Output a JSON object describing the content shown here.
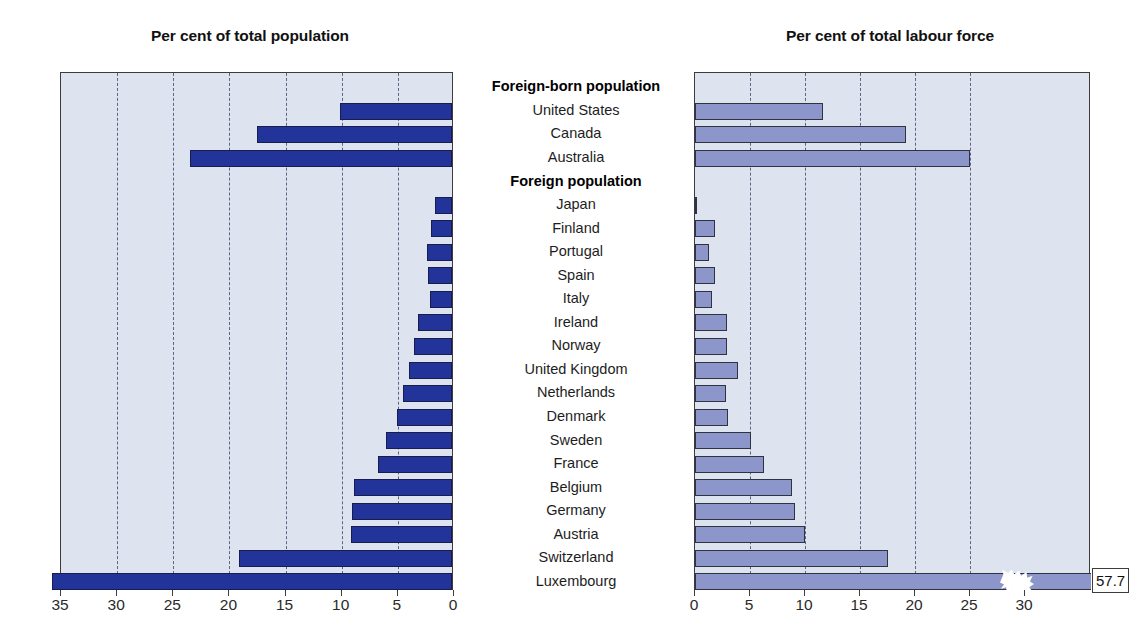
{
  "left_chart": {
    "title": "Per cent of total population",
    "axis_ticks": [
      "35",
      "30",
      "25",
      "20",
      "15",
      "10",
      "5",
      "0"
    ]
  },
  "right_chart": {
    "title": "Per cent of total labour force",
    "axis_ticks": [
      "0",
      "5",
      "10",
      "15",
      "20",
      "25",
      "30"
    ],
    "luxembourg_value_label": "57.7"
  },
  "colors": {
    "left_bar": "#22349a",
    "right_bar": "#8c96ca",
    "plot_background": "#dde4f0",
    "gridline": "#5b6480",
    "frame": "#3c3c3c"
  },
  "rows": [
    {
      "label": "Foreign-born population",
      "header": true,
      "pop": null,
      "labour": null
    },
    {
      "label": "United States",
      "header": false,
      "pop": 10.0,
      "labour": 11.6
    },
    {
      "label": "Canada",
      "header": false,
      "pop": 17.4,
      "labour": 19.2
    },
    {
      "label": "Australia",
      "header": false,
      "pop": 23.3,
      "labour": 25.0
    },
    {
      "label": "Foreign population",
      "header": true,
      "pop": null,
      "labour": null
    },
    {
      "label": "Japan",
      "header": false,
      "pop": 1.5,
      "labour": 0.2
    },
    {
      "label": "Finland",
      "header": false,
      "pop": 1.9,
      "labour": 1.8
    },
    {
      "label": "Portugal",
      "header": false,
      "pop": 2.2,
      "labour": 1.3
    },
    {
      "label": "Spain",
      "header": false,
      "pop": 2.1,
      "labour": 1.8
    },
    {
      "label": "Italy",
      "header": false,
      "pop": 2.0,
      "labour": 1.5
    },
    {
      "label": "Ireland",
      "header": false,
      "pop": 3.0,
      "labour": 2.9
    },
    {
      "label": "Norway",
      "header": false,
      "pop": 3.4,
      "labour": 2.9
    },
    {
      "label": "United Kingdom",
      "header": false,
      "pop": 3.8,
      "labour": 3.9
    },
    {
      "label": "Netherlands",
      "header": false,
      "pop": 4.4,
      "labour": 2.8
    },
    {
      "label": "Denmark",
      "header": false,
      "pop": 4.9,
      "labour": 3.0
    },
    {
      "label": "Sweden",
      "header": false,
      "pop": 5.9,
      "labour": 5.1
    },
    {
      "label": "France",
      "header": false,
      "pop": 6.6,
      "labour": 6.3
    },
    {
      "label": "Belgium",
      "header": false,
      "pop": 8.7,
      "labour": 8.8
    },
    {
      "label": "Germany",
      "header": false,
      "pop": 8.9,
      "labour": 9.1
    },
    {
      "label": "Austria",
      "header": false,
      "pop": 9.0,
      "labour": 10.0
    },
    {
      "label": "Switzerland",
      "header": false,
      "pop": 19.0,
      "labour": 17.5
    },
    {
      "label": "Luxembourg",
      "header": false,
      "pop": 35.6,
      "labour": 57.7
    }
  ],
  "chart_data": {
    "type": "bar",
    "orientation": "horizontal",
    "panels": [
      {
        "title": "Per cent of total population",
        "direction": "right-to-left",
        "xlabel": "",
        "ylabel": "",
        "xlim": [
          35,
          0
        ],
        "ticks": [
          35,
          30,
          25,
          20,
          15,
          10,
          5,
          0
        ],
        "grid": true,
        "bar_color": "#22349a",
        "categories": [
          "Foreign-born population",
          "United States",
          "Canada",
          "Australia",
          "Foreign population",
          "Japan",
          "Finland",
          "Portugal",
          "Spain",
          "Italy",
          "Ireland",
          "Norway",
          "United Kingdom",
          "Netherlands",
          "Denmark",
          "Sweden",
          "France",
          "Belgium",
          "Germany",
          "Austria",
          "Switzerland",
          "Luxembourg"
        ],
        "values": [
          null,
          10.0,
          17.4,
          23.3,
          null,
          1.5,
          1.9,
          2.2,
          2.1,
          2.0,
          3.0,
          3.4,
          3.8,
          4.4,
          4.9,
          5.9,
          6.6,
          8.7,
          8.9,
          9.0,
          19.0,
          35.6
        ]
      },
      {
        "title": "Per cent of total labour force",
        "direction": "left-to-right",
        "xlabel": "",
        "ylabel": "",
        "xlim": [
          0,
          36
        ],
        "ticks": [
          0,
          5,
          10,
          15,
          20,
          25,
          30
        ],
        "grid": true,
        "bar_color": "#8c96ca",
        "categories": [
          "Foreign-born population",
          "United States",
          "Canada",
          "Australia",
          "Foreign population",
          "Japan",
          "Finland",
          "Portugal",
          "Spain",
          "Italy",
          "Ireland",
          "Norway",
          "United Kingdom",
          "Netherlands",
          "Denmark",
          "Sweden",
          "France",
          "Belgium",
          "Germany",
          "Austria",
          "Switzerland",
          "Luxembourg"
        ],
        "values": [
          null,
          11.6,
          19.2,
          25.0,
          null,
          0.2,
          1.8,
          1.3,
          1.8,
          1.5,
          2.9,
          2.9,
          3.9,
          2.8,
          3.0,
          5.1,
          6.3,
          8.8,
          9.1,
          10.0,
          17.5,
          57.7
        ],
        "annotations": [
          {
            "category": "Luxembourg",
            "text": "57.7",
            "note": "axis break — bar truncated"
          }
        ]
      }
    ],
    "legend": [],
    "legend_position": "none"
  }
}
